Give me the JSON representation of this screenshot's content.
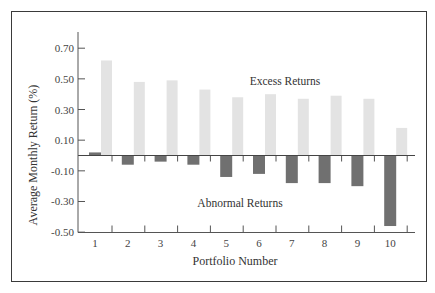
{
  "chart_data": {
    "type": "bar",
    "title": "",
    "xlabel": "Portfolio Number",
    "ylabel": "Average Monthly Return (%)",
    "categories": [
      "1",
      "2",
      "3",
      "4",
      "5",
      "6",
      "7",
      "8",
      "9",
      "10"
    ],
    "series": [
      {
        "name": "Abnormal Returns",
        "color": "#707070",
        "values": [
          0.02,
          -0.06,
          -0.04,
          -0.06,
          -0.14,
          -0.12,
          -0.18,
          -0.18,
          -0.2,
          -0.46
        ]
      },
      {
        "name": "Excess Returns",
        "color": "#e3e3e3",
        "values": [
          0.62,
          0.48,
          0.49,
          0.43,
          0.38,
          0.4,
          0.37,
          0.39,
          0.37,
          0.18
        ]
      }
    ],
    "yticks": [
      0.7,
      0.5,
      0.3,
      0.1,
      -0.1,
      -0.3,
      -0.5
    ],
    "ytick_labels": [
      "0.70",
      "0.50",
      "0.30",
      "0.10",
      "-0.10",
      "-0.30",
      "-0.50"
    ],
    "ylim": [
      -0.5,
      0.75
    ],
    "grid": false,
    "legend": "none (inline annotations)",
    "annotations": [
      {
        "text": "Excess Returns",
        "near": "above bars, right-center"
      },
      {
        "text": "Abnormal Returns",
        "near": "below zero line, center"
      }
    ]
  },
  "labels": {
    "excess": "Excess Returns",
    "abnormal": "Abnormal Returns",
    "xlabel": "Portfolio Number",
    "ylabel": "Average Monthly Return (%)"
  }
}
